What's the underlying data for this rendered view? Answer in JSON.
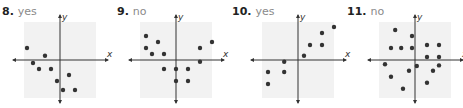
{
  "problems": [
    {
      "number": "8.",
      "answer": "yes"
    },
    {
      "number": "9.",
      "answer": "no"
    },
    {
      "number": "10.",
      "answer": "yes"
    },
    {
      "number": "11.",
      "answer": "no"
    }
  ],
  "axis_labels": {
    "x": "x",
    "y": "y"
  },
  "colors": {
    "grid_bg": "#f2f2f2",
    "axis": "#333333",
    "dot": "#333333",
    "answer_text": "#8a8a8a"
  },
  "chart_data": [
    {
      "type": "scatter",
      "title": "8. yes",
      "xlabel": "x",
      "ylabel": "y",
      "grid": false,
      "points": [
        [
          -5.5,
          2
        ],
        [
          -4.5,
          -0.5
        ],
        [
          -3.5,
          -1.5
        ],
        [
          -2.5,
          0.7
        ],
        [
          -1.5,
          -1.5
        ],
        [
          -0.5,
          -3.5
        ],
        [
          0.5,
          -5
        ],
        [
          1.5,
          -2.5
        ],
        [
          2.5,
          -5
        ]
      ]
    },
    {
      "type": "scatter",
      "title": "9. no",
      "xlabel": "x",
      "ylabel": "y",
      "grid": false,
      "points": [
        [
          -5,
          4
        ],
        [
          -5,
          2
        ],
        [
          -4,
          1
        ],
        [
          -3,
          3
        ],
        [
          -2,
          1
        ],
        [
          -2,
          -1.5
        ],
        [
          0,
          -1.5
        ],
        [
          0,
          -3.5
        ],
        [
          2,
          -1.5
        ],
        [
          2,
          -3.5
        ],
        [
          4,
          2
        ],
        [
          4,
          -0.3
        ],
        [
          6,
          3
        ]
      ]
    },
    {
      "type": "scatter",
      "title": "10. yes",
      "xlabel": "x",
      "ylabel": "y",
      "grid": false,
      "points": [
        [
          -5,
          -2
        ],
        [
          -5,
          -4
        ],
        [
          -2.3,
          -0.3
        ],
        [
          -2.3,
          -2
        ],
        [
          1,
          0.7
        ],
        [
          2,
          2.5
        ],
        [
          4,
          2.5
        ],
        [
          4,
          4.5
        ],
        [
          6,
          5.5
        ]
      ]
    },
    {
      "type": "scatter",
      "title": "11. no",
      "xlabel": "x",
      "ylabel": "y",
      "grid": false,
      "points": [
        [
          -3.3,
          5
        ],
        [
          -4,
          2
        ],
        [
          -2.3,
          2
        ],
        [
          -0.5,
          2
        ],
        [
          -0.5,
          4
        ],
        [
          2,
          2.5
        ],
        [
          4,
          2.5
        ],
        [
          2,
          0.5
        ],
        [
          4,
          0.5
        ],
        [
          -5,
          -0.7
        ],
        [
          -4,
          -2.8
        ],
        [
          -1,
          -1.8
        ],
        [
          0.3,
          -1
        ],
        [
          3,
          -1.8
        ],
        [
          4,
          -0.9
        ],
        [
          2,
          -3.8
        ],
        [
          -2,
          -4.8
        ]
      ]
    }
  ]
}
